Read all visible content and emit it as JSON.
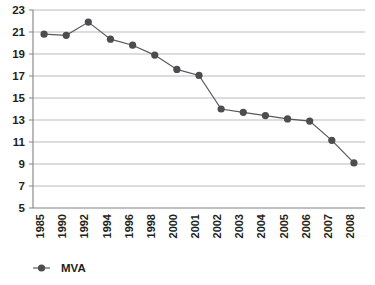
{
  "chart_data": {
    "type": "line",
    "title": "",
    "subtitle": "",
    "xlabel": "",
    "ylabel": "",
    "grid": true,
    "legend_position": "bottom-left",
    "ylim": [
      5,
      23
    ],
    "ytick_step": 2,
    "ytick_labels": [
      "5",
      "7",
      "9",
      "11",
      "13",
      "15",
      "17",
      "19",
      "21",
      "23"
    ],
    "yticks": [
      5,
      7,
      9,
      11,
      13,
      15,
      17,
      19,
      21,
      23
    ],
    "categories": [
      "1985",
      "1990",
      "1992",
      "1994",
      "1996",
      "1998",
      "2000",
      "2001",
      "2002",
      "2003",
      "2004",
      "2005",
      "2006",
      "2007",
      "2008"
    ],
    "series": [
      {
        "name": "MVA",
        "color": "#4d4d4f",
        "marker": "circle",
        "values": [
          20.8,
          20.7,
          21.9,
          20.35,
          19.8,
          18.9,
          17.6,
          17.05,
          14.0,
          13.7,
          13.4,
          13.1,
          12.9,
          11.15,
          9.1
        ]
      }
    ]
  },
  "legend": {
    "items": [
      {
        "label": "MVA",
        "color": "#4d4d4f",
        "marker": "circle"
      }
    ]
  },
  "axes": {
    "y_axis_name": "value-axis",
    "x_axis_name": "year-axis"
  }
}
